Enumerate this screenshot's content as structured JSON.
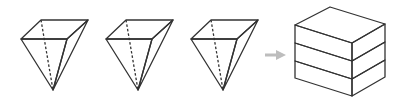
{
  "diagram": {
    "colors": {
      "shaded": "#c9c9c9",
      "white": "#ffffff",
      "edge": "#333333",
      "arrow": "#bdbdbd"
    },
    "pieces": [
      {
        "name": "pyramid-1",
        "fill": "shaded"
      },
      {
        "name": "pyramid-2",
        "fill": "white"
      },
      {
        "name": "pyramid-3",
        "fill": "shaded"
      }
    ],
    "arrow": {
      "direction": "right"
    },
    "result": {
      "shape": "rectangular block",
      "layers": [
        "shaded",
        "white",
        "shaded"
      ]
    }
  }
}
